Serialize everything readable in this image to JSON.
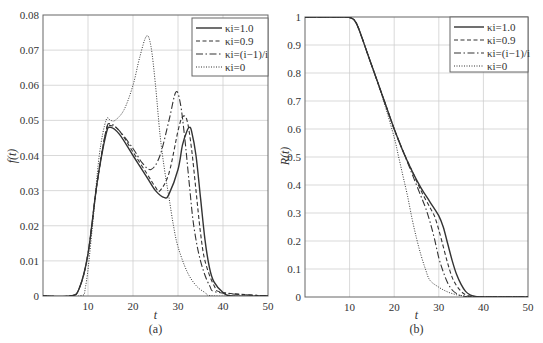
{
  "chart_data": [
    {
      "type": "line",
      "caption": "(a)",
      "xlabel": "t",
      "ylabel": "f(t)",
      "xlim": [
        0,
        50
      ],
      "ylim": [
        0,
        0.08
      ],
      "xticks": [
        10,
        20,
        30,
        40,
        50
      ],
      "xtick_labels": [
        "10",
        "20",
        "30",
        "40",
        "50"
      ],
      "yticks": [
        0,
        0.01,
        0.02,
        0.03,
        0.04,
        0.05,
        0.06,
        0.07,
        0.08
      ],
      "ytick_labels": [
        "0",
        "0.01",
        "0.02",
        "0.03",
        "0.04",
        "0.05",
        "0.06",
        "0.07",
        "0.08"
      ],
      "grid": true,
      "legend_position": "upper right",
      "series": [
        {
          "name": "κi=1.0",
          "style": "solid",
          "x": [
            0,
            6,
            8,
            10,
            12,
            14,
            15,
            17,
            20,
            23,
            25,
            27,
            28,
            30,
            31,
            32,
            32.5,
            33,
            34,
            35,
            36,
            37,
            38,
            40,
            42,
            50
          ],
          "y": [
            0,
            0,
            0.002,
            0.012,
            0.032,
            0.046,
            0.048,
            0.046,
            0.04,
            0.034,
            0.03,
            0.028,
            0.029,
            0.036,
            0.043,
            0.047,
            0.048,
            0.047,
            0.04,
            0.028,
            0.016,
            0.008,
            0.004,
            0.001,
            0,
            0
          ]
        },
        {
          "name": "κi=0.9",
          "style": "dashed",
          "x": [
            0,
            6,
            8,
            10,
            12,
            14,
            15,
            17,
            20,
            23,
            25,
            26,
            28,
            30,
            31,
            32,
            33,
            34,
            35,
            36,
            38,
            40,
            50
          ],
          "y": [
            0,
            0,
            0.002,
            0.012,
            0.032,
            0.047,
            0.0485,
            0.047,
            0.041,
            0.035,
            0.031,
            0.03,
            0.035,
            0.047,
            0.051,
            0.05,
            0.042,
            0.03,
            0.018,
            0.01,
            0.003,
            0.001,
            0
          ]
        },
        {
          "name": "κi=(i−1)/i",
          "style": "dashdot",
          "x": [
            0,
            6,
            8,
            10,
            12,
            14,
            15,
            17,
            20,
            22,
            24,
            26,
            28,
            29.5,
            30.5,
            31.5,
            32.5,
            33.5,
            35,
            37,
            39,
            50
          ],
          "y": [
            0,
            0,
            0.002,
            0.012,
            0.032,
            0.047,
            0.049,
            0.047,
            0.042,
            0.038,
            0.036,
            0.04,
            0.05,
            0.058,
            0.055,
            0.045,
            0.032,
            0.02,
            0.01,
            0.003,
            0.001,
            0
          ]
        },
        {
          "name": "κi=0",
          "style": "dotted",
          "x": [
            0,
            8,
            9.5,
            11,
            12.5,
            14,
            15,
            16,
            18,
            20,
            21.5,
            23,
            24,
            25,
            26,
            27,
            28,
            29,
            30,
            32,
            34,
            36,
            38,
            50
          ],
          "y": [
            0,
            0,
            0.003,
            0.02,
            0.04,
            0.05,
            0.05,
            0.05,
            0.053,
            0.06,
            0.068,
            0.074,
            0.071,
            0.06,
            0.046,
            0.036,
            0.028,
            0.02,
            0.014,
            0.007,
            0.003,
            0.001,
            0,
            0
          ]
        }
      ]
    },
    {
      "type": "line",
      "caption": "(b)",
      "xlabel": "t",
      "ylabel": "R(t)",
      "xlim": [
        0,
        50
      ],
      "ylim": [
        0,
        1
      ],
      "xticks": [
        10,
        20,
        30,
        40,
        50
      ],
      "xtick_labels": [
        "10",
        "20",
        "30",
        "40",
        "50"
      ],
      "yticks": [
        0,
        0.1,
        0.2,
        0.3,
        0.4,
        0.5,
        0.6,
        0.7,
        0.8,
        0.9,
        1
      ],
      "ytick_labels": [
        "0",
        "0.1",
        "0.2",
        "0.3",
        "0.4",
        "0.5",
        "0.6",
        "0.7",
        "0.8",
        "0.9",
        "1"
      ],
      "grid": true,
      "legend_position": "upper right",
      "series": [
        {
          "name": "κi=1.0",
          "style": "solid",
          "x": [
            0,
            9,
            10,
            11,
            12,
            14,
            16,
            18,
            20,
            22,
            24,
            26,
            28,
            30,
            31,
            32,
            33,
            34,
            35,
            36,
            37,
            38,
            40,
            50
          ],
          "y": [
            1,
            1,
            0.998,
            0.99,
            0.96,
            0.87,
            0.78,
            0.69,
            0.6,
            0.52,
            0.45,
            0.39,
            0.34,
            0.29,
            0.25,
            0.19,
            0.13,
            0.08,
            0.045,
            0.02,
            0.008,
            0.003,
            0,
            0
          ]
        },
        {
          "name": "κi=0.9",
          "style": "dashed",
          "x": [
            0,
            9,
            10,
            11,
            12,
            14,
            16,
            18,
            20,
            22,
            24,
            26,
            28,
            29,
            30,
            31,
            32,
            33,
            34,
            35,
            36,
            37,
            38,
            40,
            50
          ],
          "y": [
            1,
            1,
            0.998,
            0.99,
            0.96,
            0.87,
            0.78,
            0.69,
            0.6,
            0.52,
            0.45,
            0.38,
            0.32,
            0.29,
            0.24,
            0.18,
            0.12,
            0.07,
            0.04,
            0.02,
            0.008,
            0.003,
            0.001,
            0,
            0
          ]
        },
        {
          "name": "κi=(i−1)/i",
          "style": "dashdot",
          "x": [
            0,
            9,
            10,
            11,
            12,
            14,
            16,
            18,
            20,
            22,
            24,
            26,
            27,
            28,
            29,
            30,
            31,
            32,
            33,
            34,
            35,
            36,
            38,
            40,
            50
          ],
          "y": [
            1,
            1,
            0.998,
            0.99,
            0.96,
            0.87,
            0.78,
            0.69,
            0.6,
            0.52,
            0.44,
            0.36,
            0.32,
            0.27,
            0.21,
            0.14,
            0.09,
            0.05,
            0.025,
            0.012,
            0.005,
            0.002,
            0,
            0,
            0
          ]
        },
        {
          "name": "κi=0",
          "style": "dotted",
          "x": [
            0,
            9,
            10,
            11,
            12,
            14,
            16,
            18,
            20,
            21,
            22,
            23,
            24,
            25,
            26,
            27,
            28,
            30,
            32,
            34,
            36,
            38,
            50
          ],
          "y": [
            1,
            1,
            0.998,
            0.99,
            0.96,
            0.87,
            0.78,
            0.68,
            0.57,
            0.5,
            0.43,
            0.36,
            0.28,
            0.21,
            0.15,
            0.1,
            0.06,
            0.035,
            0.018,
            0.008,
            0.003,
            0.001,
            0
          ]
        }
      ]
    }
  ]
}
